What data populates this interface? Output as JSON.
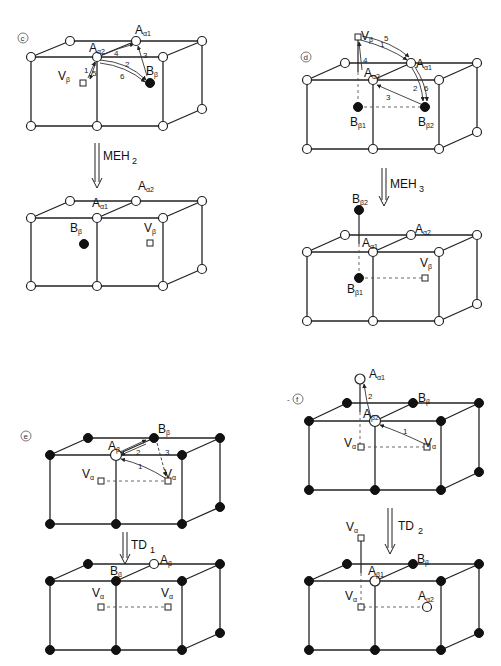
{
  "header": {
    "left": "",
    "right": ""
  },
  "panels": [
    {
      "id": "c",
      "tag": "c",
      "before": {
        "labels": [
          {
            "main": "A",
            "sub": "α1",
            "x": 135,
            "y": 34
          },
          {
            "main": "A",
            "sub": "α2",
            "x": 89,
            "y": 52
          },
          {
            "main": "V",
            "sub": "β",
            "x": 58,
            "y": 80
          },
          {
            "main": "B",
            "sub": "β",
            "x": 146,
            "y": 75
          }
        ],
        "jump_numbers": [
          "1",
          "2",
          "3",
          "4",
          "5",
          "6"
        ]
      },
      "step": {
        "main": "MEH",
        "sub": "2"
      },
      "after": {
        "labels": [
          {
            "main": "A",
            "sub": "α2",
            "x": 138,
            "y": 190
          },
          {
            "main": "A",
            "sub": "α1",
            "x": 92,
            "y": 207
          },
          {
            "main": "B",
            "sub": "β",
            "x": 70,
            "y": 232
          },
          {
            "main": "V",
            "sub": "β",
            "x": 144,
            "y": 232
          }
        ]
      }
    },
    {
      "id": "d",
      "tag": "d",
      "before": {
        "labels": [
          {
            "main": "V",
            "sub": "β",
            "x": 361,
            "y": 40
          },
          {
            "main": "A",
            "sub": "α1",
            "x": 416,
            "y": 68
          },
          {
            "main": "A",
            "sub": "α2",
            "x": 364,
            "y": 77
          },
          {
            "main": "B",
            "sub": "β1",
            "x": 350,
            "y": 126
          },
          {
            "main": "B",
            "sub": "β2",
            "x": 418,
            "y": 126
          }
        ],
        "jump_numbers": [
          "1",
          "2",
          "3",
          "4",
          "5",
          "6"
        ]
      },
      "step": {
        "main": "MEH",
        "sub": "3"
      },
      "after": {
        "labels": [
          {
            "main": "B",
            "sub": "β2",
            "x": 352,
            "y": 203
          },
          {
            "main": "A",
            "sub": "α2",
            "x": 415,
            "y": 233
          },
          {
            "main": "A",
            "sub": "α1",
            "x": 362,
            "y": 247
          },
          {
            "main": "V",
            "sub": "β",
            "x": 420,
            "y": 267
          },
          {
            "main": "B",
            "sub": "β1",
            "x": 347,
            "y": 293
          }
        ]
      }
    },
    {
      "id": "e",
      "tag": "e",
      "before": {
        "labels": [
          {
            "main": "B",
            "sub": "β",
            "x": 158,
            "y": 433
          },
          {
            "main": "A",
            "sub": "β",
            "x": 108,
            "y": 450
          },
          {
            "main": "V",
            "sub": "α",
            "x": 82,
            "y": 478
          },
          {
            "main": "V",
            "sub": "α",
            "x": 164,
            "y": 478
          }
        ],
        "jump_numbers": [
          "1",
          "2",
          "3"
        ]
      },
      "step": {
        "main": "TD",
        "sub": "1"
      },
      "after": {
        "labels": [
          {
            "main": "A",
            "sub": "β",
            "x": 160,
            "y": 564
          },
          {
            "main": "B",
            "sub": "β",
            "x": 110,
            "y": 575
          },
          {
            "main": "V",
            "sub": "α",
            "x": 92,
            "y": 597
          },
          {
            "main": "V",
            "sub": "α",
            "x": 161,
            "y": 597
          }
        ]
      }
    },
    {
      "id": "f",
      "tag": "f",
      "before": {
        "labels": [
          {
            "main": "A",
            "sub": "α1",
            "x": 369,
            "y": 378
          },
          {
            "main": "B",
            "sub": "β",
            "x": 418,
            "y": 402
          },
          {
            "main": "A",
            "sub": "β2",
            "x": 363,
            "y": 418
          },
          {
            "main": "V",
            "sub": "α",
            "x": 344,
            "y": 447
          },
          {
            "main": "V",
            "sub": "α",
            "x": 424,
            "y": 447
          }
        ],
        "jump_numbers": [
          "1",
          "2"
        ]
      },
      "step": {
        "main": "TD",
        "sub": "2"
      },
      "after": {
        "labels": [
          {
            "main": "V",
            "sub": "α",
            "x": 346,
            "y": 531
          },
          {
            "main": "B",
            "sub": "β",
            "x": 417,
            "y": 563
          },
          {
            "main": "A",
            "sub": "β1",
            "x": 368,
            "y": 575
          },
          {
            "main": "V",
            "sub": "α",
            "x": 345,
            "y": 600
          },
          {
            "main": "A",
            "sub": "α2",
            "x": 418,
            "y": 600
          }
        ]
      }
    }
  ]
}
